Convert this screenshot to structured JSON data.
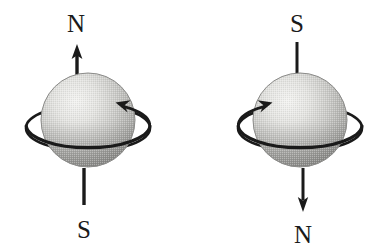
{
  "figure": {
    "background_color": "#ffffff",
    "ink_color": "#1a1a1a",
    "sphere_light_color": "#f0f0ee",
    "sphere_mid_color": "#b9b9b7",
    "sphere_dark_color": "#8e8e8c",
    "sphere_edge_color": "#7d7d7b"
  },
  "diagrams": [
    {
      "id": "left",
      "name": "left-sphere-diagram",
      "sphere": {
        "cx": 88,
        "cy": 120,
        "r": 47,
        "highlight_cx": 70,
        "highlight_cy": 100
      },
      "axis": {
        "top_label": "N",
        "bottom_label": "S",
        "top_label_x": 76,
        "top_label_y": 32,
        "bottom_label_x": 84,
        "bottom_label_y": 238,
        "top_line_x": 77,
        "top_line_y1": 46,
        "top_line_y2": 80,
        "top_arrowhead": "up",
        "bottom_line_x": 84,
        "bottom_line_y1": 168,
        "bottom_line_y2": 205,
        "bottom_arrowhead": "none"
      },
      "rotation": {
        "direction_label": "arrowhead-upper-right",
        "ellipse_cx": 88,
        "ellipse_cy": 128,
        "ellipse_rx": 62,
        "ellipse_ry": 23,
        "arrow_side": "right"
      }
    },
    {
      "id": "right",
      "name": "right-sphere-diagram",
      "sphere": {
        "cx": 300,
        "cy": 120,
        "r": 47,
        "highlight_cx": 282,
        "highlight_cy": 100
      },
      "axis": {
        "top_label": "S",
        "bottom_label": "N",
        "top_label_x": 297,
        "top_label_y": 32,
        "bottom_label_x": 303,
        "bottom_label_y": 243,
        "top_line_x": 297,
        "top_line_y1": 42,
        "top_line_y2": 85,
        "top_arrowhead": "none",
        "bottom_line_x": 303,
        "bottom_line_y1": 168,
        "bottom_line_y2": 212,
        "bottom_arrowhead": "down"
      },
      "rotation": {
        "direction_label": "arrowhead-upper-left",
        "ellipse_cx": 300,
        "ellipse_cy": 128,
        "ellipse_rx": 62,
        "ellipse_ry": 23,
        "arrow_side": "left"
      }
    }
  ]
}
